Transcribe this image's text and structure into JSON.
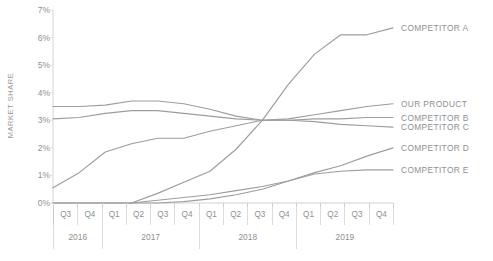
{
  "chart_data": {
    "type": "line",
    "title": "",
    "xlabel": "",
    "ylabel": "MARKET SHARE",
    "ylim": [
      0,
      7
    ],
    "ytick_labels": [
      "0%",
      "1%",
      "2%",
      "3%",
      "4%",
      "5%",
      "6%",
      "7%"
    ],
    "ytick_values": [
      0,
      1,
      2,
      3,
      4,
      5,
      6,
      7
    ],
    "grid": true,
    "legend_position": "right",
    "x": [
      "Q3",
      "Q4",
      "Q1",
      "Q2",
      "Q3",
      "Q4",
      "Q1",
      "Q2",
      "Q3",
      "Q4",
      "Q1",
      "Q2",
      "Q3",
      "Q4"
    ],
    "x_groups": [
      {
        "label": "2016",
        "quarters": [
          "Q3",
          "Q4"
        ]
      },
      {
        "label": "2017",
        "quarters": [
          "Q1",
          "Q2",
          "Q3",
          "Q4"
        ]
      },
      {
        "label": "2018",
        "quarters": [
          "Q1",
          "Q2",
          "Q3",
          "Q4"
        ]
      },
      {
        "label": "2019",
        "quarters": [
          "Q1",
          "Q2",
          "Q3",
          "Q4"
        ]
      }
    ],
    "series": [
      {
        "name": "COMPETITOR A",
        "label_value": 6.35,
        "values": [
          null,
          null,
          null,
          0.0,
          0.35,
          0.75,
          1.15,
          1.95,
          3.0,
          4.3,
          5.4,
          6.1,
          6.1,
          6.35
        ]
      },
      {
        "name": "OUR PRODUCT",
        "label_value": 3.6,
        "values": [
          3.5,
          3.5,
          3.55,
          3.7,
          3.7,
          3.6,
          3.4,
          3.15,
          3.0,
          3.05,
          3.2,
          3.35,
          3.5,
          3.6
        ]
      },
      {
        "name": "COMPETITOR B",
        "label_value": 3.1,
        "values": [
          3.05,
          3.1,
          3.25,
          3.35,
          3.35,
          3.25,
          3.15,
          3.05,
          3.0,
          3.0,
          3.05,
          3.05,
          3.1,
          3.1
        ]
      },
      {
        "name": "COMPETITOR C",
        "label_value": 2.75,
        "values": [
          0.55,
          1.1,
          1.85,
          2.15,
          2.35,
          2.35,
          2.6,
          2.8,
          3.0,
          3.0,
          2.95,
          2.85,
          2.8,
          2.75
        ]
      },
      {
        "name": "COMPETITOR D",
        "label_value": 2.0,
        "values": [
          0.0,
          0.0,
          0.0,
          0.0,
          0.1,
          0.2,
          0.3,
          0.45,
          0.6,
          0.8,
          1.1,
          1.35,
          1.7,
          2.0
        ]
      },
      {
        "name": "COMPETITOR E",
        "label_value": 1.2,
        "values": [
          0.0,
          0.0,
          0.0,
          0.0,
          0.0,
          0.05,
          0.15,
          0.3,
          0.5,
          0.8,
          1.05,
          1.15,
          1.2,
          1.2
        ]
      }
    ]
  },
  "colors": {
    "line": "#9d9d9d",
    "grid": "#d8d8d8",
    "axis": "#c9c9c9",
    "text": "#8f8f8f"
  }
}
